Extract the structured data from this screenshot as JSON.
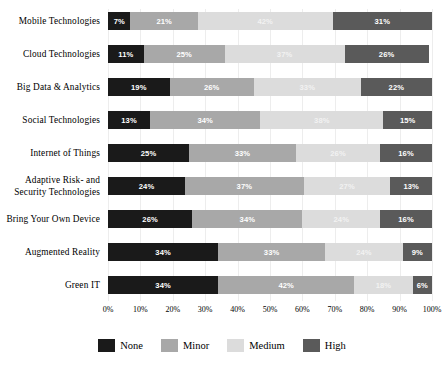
{
  "chart_data": {
    "type": "bar",
    "orientation": "horizontal",
    "stacked": true,
    "stack_mode": "percent",
    "title": "",
    "subtitle": "",
    "xlabel": "",
    "ylabel": "",
    "xlim": [
      0,
      100
    ],
    "xticks": [
      "0%",
      "10%",
      "20%",
      "30%",
      "40%",
      "50%",
      "60%",
      "70%",
      "80%",
      "90%",
      "100%"
    ],
    "xtick_values": [
      0,
      10,
      20,
      30,
      40,
      50,
      60,
      70,
      80,
      90,
      100
    ],
    "grid": true,
    "legend_position": "bottom",
    "value_label_suffix": "%",
    "categories": [
      "Mobile Technologies",
      "Cloud Technologies",
      "Big Data & Analytics",
      "Social Technologies",
      "Internet of Things",
      "Adaptive Risk- and\nSecurity Technologies",
      "Bring Your Own Device",
      "Augmented Reality",
      "Green IT"
    ],
    "series": [
      {
        "name": "None",
        "color": "#1a1a1a",
        "values": [
          7,
          11,
          19,
          13,
          25,
          24,
          26,
          34,
          34
        ],
        "labels": [
          "7%",
          "11%",
          "19%",
          "13%",
          "25%",
          "24%",
          "26%",
          "34%",
          "34%"
        ]
      },
      {
        "name": "Minor",
        "color": "#a8a8a8",
        "values": [
          21,
          25,
          26,
          34,
          33,
          37,
          34,
          33,
          42
        ],
        "labels": [
          "21%",
          "25%",
          "26%",
          "34%",
          "33%",
          "37%",
          "34%",
          "33%",
          "42%"
        ]
      },
      {
        "name": "Medium",
        "color": "#dcdcdc",
        "values": [
          42,
          37,
          33,
          38,
          26,
          27,
          24,
          24,
          18
        ],
        "labels": [
          "42%",
          "37%",
          "33%",
          "38%",
          "26%",
          "27%",
          "24%",
          "24%",
          "18%"
        ]
      },
      {
        "name": "High",
        "color": "#5a5a5a",
        "values": [
          31,
          26,
          22,
          15,
          16,
          13,
          16,
          9,
          6
        ],
        "labels": [
          "31%",
          "26%",
          "22%",
          "15%",
          "16%",
          "13%",
          "16%",
          "9%",
          "6%"
        ]
      }
    ],
    "rows": [
      {
        "category": "Mobile Technologies",
        "segments": [
          {
            "name": "None",
            "value": 7,
            "label": "7%"
          },
          {
            "name": "Minor",
            "value": 21,
            "label": "21%"
          },
          {
            "name": "Medium",
            "value": 42,
            "label": "42%"
          },
          {
            "name": "High",
            "value": 31,
            "label": "31%"
          }
        ]
      },
      {
        "category": "Cloud Technologies",
        "segments": [
          {
            "name": "None",
            "value": 11,
            "label": "11%"
          },
          {
            "name": "Minor",
            "value": 25,
            "label": "25%"
          },
          {
            "name": "Medium",
            "value": 37,
            "label": "37%"
          },
          {
            "name": "High",
            "value": 26,
            "label": "26%"
          }
        ]
      },
      {
        "category": "Big Data & Analytics",
        "segments": [
          {
            "name": "None",
            "value": 19,
            "label": "19%"
          },
          {
            "name": "Minor",
            "value": 26,
            "label": "26%"
          },
          {
            "name": "Medium",
            "value": 33,
            "label": "33%"
          },
          {
            "name": "High",
            "value": 22,
            "label": "22%"
          }
        ]
      },
      {
        "category": "Social Technologies",
        "segments": [
          {
            "name": "None",
            "value": 13,
            "label": "13%"
          },
          {
            "name": "Minor",
            "value": 34,
            "label": "34%"
          },
          {
            "name": "Medium",
            "value": 38,
            "label": "38%"
          },
          {
            "name": "High",
            "value": 15,
            "label": "15%"
          }
        ]
      },
      {
        "category": "Internet of Things",
        "segments": [
          {
            "name": "None",
            "value": 25,
            "label": "25%"
          },
          {
            "name": "Minor",
            "value": 33,
            "label": "33%"
          },
          {
            "name": "Medium",
            "value": 26,
            "label": "26%"
          },
          {
            "name": "High",
            "value": 16,
            "label": "16%"
          }
        ]
      },
      {
        "category": "Adaptive Risk- and\nSecurity Technologies",
        "segments": [
          {
            "name": "None",
            "value": 24,
            "label": "24%"
          },
          {
            "name": "Minor",
            "value": 37,
            "label": "37%"
          },
          {
            "name": "Medium",
            "value": 27,
            "label": "27%"
          },
          {
            "name": "High",
            "value": 13,
            "label": "13%"
          }
        ]
      },
      {
        "category": "Bring Your Own Device",
        "segments": [
          {
            "name": "None",
            "value": 26,
            "label": "26%"
          },
          {
            "name": "Minor",
            "value": 34,
            "label": "34%"
          },
          {
            "name": "Medium",
            "value": 24,
            "label": "24%"
          },
          {
            "name": "High",
            "value": 16,
            "label": "16%"
          }
        ]
      },
      {
        "category": "Augmented Reality",
        "segments": [
          {
            "name": "None",
            "value": 34,
            "label": "34%"
          },
          {
            "name": "Minor",
            "value": 33,
            "label": "33%"
          },
          {
            "name": "Medium",
            "value": 24,
            "label": "24%"
          },
          {
            "name": "High",
            "value": 9,
            "label": "9%"
          }
        ]
      },
      {
        "category": "Green IT",
        "segments": [
          {
            "name": "None",
            "value": 34,
            "label": "34%"
          },
          {
            "name": "Minor",
            "value": 42,
            "label": "42%"
          },
          {
            "name": "Medium",
            "value": 18,
            "label": "18%"
          },
          {
            "name": "High",
            "value": 6,
            "label": "6%"
          }
        ]
      }
    ],
    "legend": [
      {
        "label": "None",
        "color": "#1a1a1a"
      },
      {
        "label": "Minor",
        "color": "#a8a8a8"
      },
      {
        "label": "Medium",
        "color": "#dcdcdc"
      },
      {
        "label": "High",
        "color": "#5a5a5a"
      }
    ]
  }
}
